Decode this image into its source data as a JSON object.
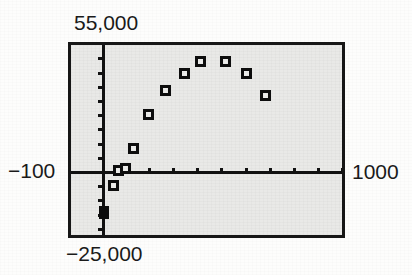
{
  "figure": {
    "kind": "graphing-calculator-scatter-plot",
    "frame_fill_color": "#e9e9e7",
    "frame_border_color": "#161616",
    "marker_color": "#0d0d0d",
    "page_color": "#fdfdfc"
  },
  "labels": {
    "y_max": "55,000",
    "y_min": "−25,000",
    "x_min": "−100",
    "x_max": "1000"
  },
  "ghost_text": [
    {
      "text": "a graph of",
      "left": 236,
      "top": 52,
      "size": 17
    },
    {
      "text": "in la ampli",
      "left": 228,
      "top": 84,
      "size": 20
    },
    {
      "text": "ho pa sta sy thi",
      "left": 218,
      "top": 113,
      "size": 18
    },
    {
      "text": "n  thea  ris",
      "left": 232,
      "top": 142,
      "size": 20
    },
    {
      "text": "rea co ma ne",
      "left": 196,
      "top": 191,
      "size": 14
    }
  ],
  "chart_data": {
    "type": "scatter",
    "title": "",
    "xlabel": "",
    "ylabel": "",
    "xlim": [
      -100,
      1000
    ],
    "ylim": [
      -25000,
      55000
    ],
    "grid": false,
    "legend": null,
    "x_axis_tick_step": 100,
    "y_axis_tick_step": 5000,
    "x": [
      0,
      25,
      50,
      100,
      150,
      225,
      300,
      400,
      500,
      600,
      700,
      800
    ],
    "y": [
      -21500,
      -3500,
      600,
      1100,
      13800,
      25600,
      33800,
      40900,
      45200,
      45200,
      40800,
      33500
    ],
    "point_count": 12,
    "points": [
      {
        "x": 0,
        "y": -21500,
        "px": 104,
        "py": 212,
        "style": "filled"
      },
      {
        "x": 25,
        "y": -3500,
        "px": 113,
        "py": 185,
        "style": "open"
      },
      {
        "x": 50,
        "y": 600,
        "px": 118,
        "py": 170,
        "style": "open"
      },
      {
        "x": 100,
        "y": 1100,
        "px": 125,
        "py": 168,
        "style": "open"
      },
      {
        "x": 150,
        "y": 13800,
        "px": 133,
        "py": 148,
        "style": "open"
      },
      {
        "x": 225,
        "y": 25600,
        "px": 148,
        "py": 114,
        "style": "open"
      },
      {
        "x": 300,
        "y": 33800,
        "px": 165,
        "py": 90,
        "style": "open"
      },
      {
        "x": 400,
        "y": 40900,
        "px": 184,
        "py": 73,
        "style": "open"
      },
      {
        "x": 500,
        "y": 45200,
        "px": 200,
        "py": 61,
        "style": "open"
      },
      {
        "x": 600,
        "y": 45200,
        "px": 225,
        "py": 61,
        "style": "open"
      },
      {
        "x": 700,
        "y": 40800,
        "px": 246,
        "py": 73,
        "style": "open"
      },
      {
        "x": 800,
        "y": 33500,
        "px": 265,
        "py": 95,
        "style": "open"
      }
    ]
  }
}
